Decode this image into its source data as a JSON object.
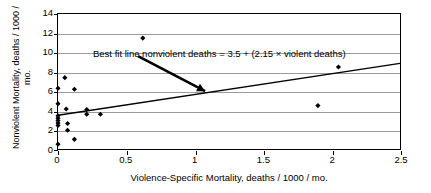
{
  "chart_data": {
    "type": "scatter",
    "title": "",
    "xlabel": "Violence-Specific Mortality, deaths / 1000 / mo.",
    "ylabel": "Nonviolent Mortality, deaths / 1000 / mo.",
    "xlim": [
      0,
      2.5
    ],
    "ylim": [
      0,
      14
    ],
    "xticks": [
      0,
      0.5,
      1,
      1.5,
      2,
      2.5
    ],
    "xticklabels": [
      "0",
      "0.5",
      "1",
      "1.5",
      "2",
      "2.5"
    ],
    "yticks": [
      0,
      2,
      4,
      6,
      8,
      10,
      12,
      14
    ],
    "yticklabels": [
      "0",
      "2",
      "4",
      "6",
      "8",
      "10",
      "12",
      "14"
    ],
    "grid": "horizontal",
    "legend": "none",
    "marker": "diamond",
    "marker_color": "#000000",
    "points": [
      {
        "x": 0.0,
        "y": 6.3
      },
      {
        "x": 0.0,
        "y": 4.7
      },
      {
        "x": 0.0,
        "y": 3.45
      },
      {
        "x": 0.0,
        "y": 3.2
      },
      {
        "x": 0.0,
        "y": 2.95
      },
      {
        "x": 0.0,
        "y": 2.7
      },
      {
        "x": 0.0,
        "y": 2.45
      },
      {
        "x": 0.0,
        "y": 0.5
      },
      {
        "x": 0.05,
        "y": 7.4
      },
      {
        "x": 0.06,
        "y": 4.15
      },
      {
        "x": 0.07,
        "y": 2.65
      },
      {
        "x": 0.07,
        "y": 1.95
      },
      {
        "x": 0.12,
        "y": 6.2
      },
      {
        "x": 0.12,
        "y": 1.0
      },
      {
        "x": 0.21,
        "y": 4.1
      },
      {
        "x": 0.21,
        "y": 3.6
      },
      {
        "x": 0.31,
        "y": 3.6
      },
      {
        "x": 0.62,
        "y": 11.5
      },
      {
        "x": 1.9,
        "y": 4.5
      },
      {
        "x": 2.05,
        "y": 8.5
      }
    ],
    "fit_line": {
      "label": "Best fit line nonviolent deaths = 3.5 + (2.15 × violent deaths)",
      "intercept": 3.5,
      "slope": 2.15,
      "x_start": 0.0,
      "x_end": 2.5,
      "color": "#000000"
    },
    "annotation_arrow": {
      "from_x": 0.585,
      "from_y": 9.62,
      "to_x": 1.075,
      "to_y": 6.0
    }
  }
}
